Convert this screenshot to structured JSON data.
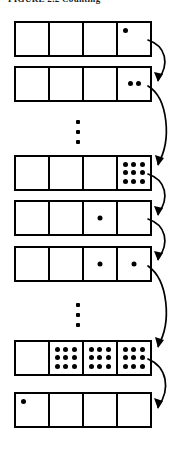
{
  "figure": {
    "title_sliver": "FIGURE 2.2  Counting",
    "type": "odometer-counter-diagram",
    "register_cells": 4,
    "max_dots_per_cell": 9,
    "rows": [
      {
        "name": "row-1",
        "cells": [
          {
            "dots": 0,
            "style": "empty"
          },
          {
            "dots": 0,
            "style": "empty"
          },
          {
            "dots": 0,
            "style": "empty"
          },
          {
            "dots": 1,
            "style": "corner"
          }
        ]
      },
      {
        "name": "row-2",
        "cells": [
          {
            "dots": 0,
            "style": "empty"
          },
          {
            "dots": 0,
            "style": "empty"
          },
          {
            "dots": 0,
            "style": "empty"
          },
          {
            "dots": 2,
            "style": "pair"
          }
        ]
      },
      {
        "name": "row-3",
        "cells": [
          {
            "dots": 0,
            "style": "empty"
          },
          {
            "dots": 0,
            "style": "empty"
          },
          {
            "dots": 0,
            "style": "empty"
          },
          {
            "dots": 9,
            "style": "grid"
          }
        ]
      },
      {
        "name": "row-4",
        "cells": [
          {
            "dots": 0,
            "style": "empty"
          },
          {
            "dots": 0,
            "style": "empty"
          },
          {
            "dots": 1,
            "style": "center"
          },
          {
            "dots": 0,
            "style": "empty"
          }
        ]
      },
      {
        "name": "row-5",
        "cells": [
          {
            "dots": 0,
            "style": "empty"
          },
          {
            "dots": 0,
            "style": "empty"
          },
          {
            "dots": 1,
            "style": "center"
          },
          {
            "dots": 1,
            "style": "center"
          }
        ]
      },
      {
        "name": "row-6",
        "cells": [
          {
            "dots": 0,
            "style": "empty"
          },
          {
            "dots": 9,
            "style": "grid"
          },
          {
            "dots": 9,
            "style": "grid"
          },
          {
            "dots": 9,
            "style": "grid"
          }
        ]
      },
      {
        "name": "row-7",
        "cells": [
          {
            "dots": 1,
            "style": "corner"
          },
          {
            "dots": 0,
            "style": "empty"
          },
          {
            "dots": 0,
            "style": "empty"
          },
          {
            "dots": 0,
            "style": "empty"
          }
        ]
      }
    ],
    "ellipses": [
      {
        "name": "vertical-ellipsis-1",
        "after_row": 2,
        "dots": 3
      },
      {
        "name": "vertical-ellipsis-2",
        "after_row": 5,
        "dots": 3
      }
    ],
    "arrows": [
      {
        "name": "transition-arrow-1",
        "from_row": 1,
        "to_row": 2
      },
      {
        "name": "transition-arrow-2",
        "from_row": 2,
        "to_row": 3
      },
      {
        "name": "transition-arrow-3",
        "from_row": 3,
        "to_row": 4
      },
      {
        "name": "transition-arrow-4",
        "from_row": 4,
        "to_row": 5
      },
      {
        "name": "transition-arrow-5",
        "from_row": 5,
        "to_row": 6
      },
      {
        "name": "transition-arrow-6",
        "from_row": 6,
        "to_row": 7
      }
    ],
    "colors": {
      "ink": "#000000",
      "paper": "#ffffff"
    }
  }
}
